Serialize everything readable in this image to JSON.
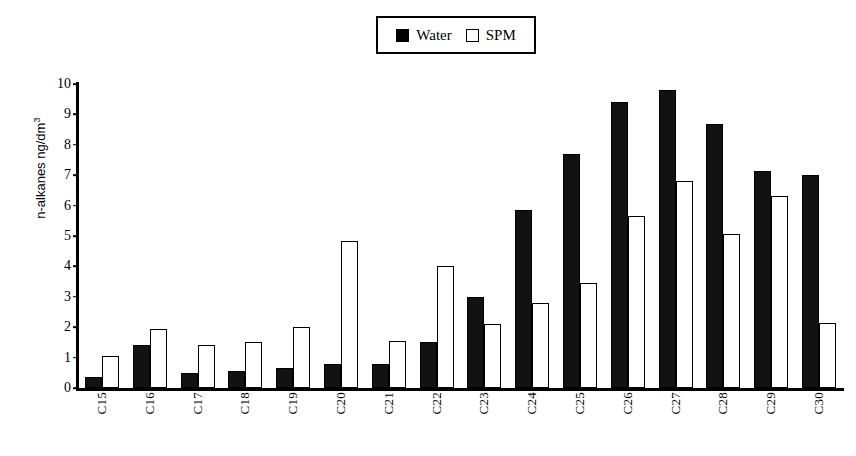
{
  "legend": {
    "entries": [
      {
        "label": "Water",
        "style": "filled",
        "color": "#121212"
      },
      {
        "label": "SPM",
        "style": "hollow",
        "color": "#ffffff"
      }
    ]
  },
  "axis": {
    "y_title_main": "n-alkanes ng/dm",
    "y_title_sup": "3",
    "y_ticks": [
      "0",
      "1",
      "2",
      "3",
      "4",
      "5",
      "6",
      "7",
      "8",
      "9",
      "10"
    ]
  },
  "chart_data": {
    "type": "bar",
    "title": "",
    "xlabel": "",
    "ylabel": "n-alkanes ng/dm3",
    "ylim": [
      0,
      10
    ],
    "grid": false,
    "legend_position": "top-center",
    "categories": [
      "C15",
      "C16",
      "C17",
      "C18",
      "C19",
      "C20",
      "C21",
      "C22",
      "C23",
      "C24",
      "C25",
      "C26",
      "C27",
      "C28",
      "C29",
      "C30"
    ],
    "series": [
      {
        "name": "Water",
        "color": "#121212",
        "values": [
          0.35,
          1.4,
          0.5,
          0.55,
          0.65,
          0.8,
          0.8,
          1.5,
          3.0,
          5.85,
          7.7,
          9.4,
          9.8,
          8.7,
          7.15,
          7.0
        ]
      },
      {
        "name": "SPM",
        "color": "#ffffff",
        "values": [
          1.05,
          1.95,
          1.4,
          1.5,
          2.0,
          4.85,
          1.55,
          4.0,
          2.1,
          2.8,
          3.45,
          5.65,
          6.8,
          5.05,
          6.3,
          2.15
        ]
      }
    ]
  }
}
